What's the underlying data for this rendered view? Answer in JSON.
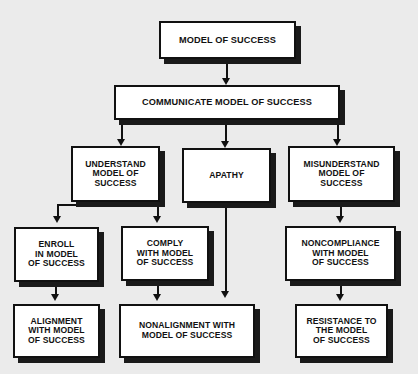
{
  "diagram": {
    "background_color": "#ebebeb",
    "box_fill_color": "#ffffff",
    "line_color": "#111111",
    "shadow_color": "#1a1a1a",
    "nodes": [
      {
        "id": "model_of_success",
        "text": "MODEL OF SUCCESS"
      },
      {
        "id": "communicate",
        "text": "COMMUNICATE MODEL OF SUCCESS"
      },
      {
        "id": "understand",
        "text": "UNDERSTAND\nMODEL OF\nSUCCESS"
      },
      {
        "id": "apathy",
        "text": "APATHY"
      },
      {
        "id": "misunderstand",
        "text": "MISUNDERSTAND\nMODEL OF\nSUCCESS"
      },
      {
        "id": "enroll",
        "text": "ENROLL\nIN MODEL\nOF SUCCESS"
      },
      {
        "id": "comply",
        "text": "COMPLY\nWITH MODEL\nOF SUCCESS"
      },
      {
        "id": "noncompliance",
        "text": "NONCOMPLIANCE\nWITH MODEL\nOF SUCCESS"
      },
      {
        "id": "alignment",
        "text": "ALIGNMENT\nWITH MODEL\nOF SUCCESS"
      },
      {
        "id": "nonalignment",
        "text": "NONALIGNMENT WITH\nMODEL OF SUCCESS"
      },
      {
        "id": "resistance",
        "text": "RESISTANCE TO\nTHE MODEL\nOF SUCCESS"
      }
    ],
    "edges": [
      {
        "from": "model_of_success",
        "to": "communicate"
      },
      {
        "from": "communicate",
        "to": "understand"
      },
      {
        "from": "communicate",
        "to": "apathy"
      },
      {
        "from": "communicate",
        "to": "misunderstand"
      },
      {
        "from": "understand",
        "to": "enroll"
      },
      {
        "from": "understand",
        "to": "comply"
      },
      {
        "from": "misunderstand",
        "to": "noncompliance"
      },
      {
        "from": "enroll",
        "to": "alignment"
      },
      {
        "from": "comply",
        "to": "nonalignment"
      },
      {
        "from": "apathy",
        "to": "nonalignment"
      },
      {
        "from": "noncompliance",
        "to": "resistance"
      }
    ]
  }
}
